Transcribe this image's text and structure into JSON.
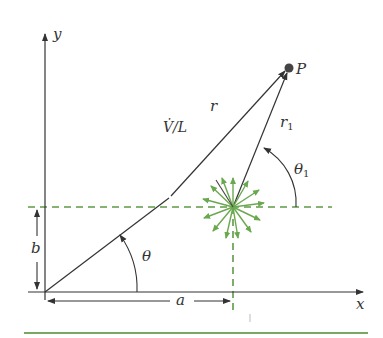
{
  "diagram": {
    "labels": {
      "y_axis": "y",
      "x_axis": "x",
      "point": "P",
      "r": "r",
      "r1": "r",
      "r1_sub": "1",
      "strength": "V̇/L",
      "theta": "θ",
      "theta1": "θ",
      "theta1_sub": "1",
      "a": "a",
      "b": "b"
    },
    "colors": {
      "line": "#333333",
      "source": "#6aa84f",
      "dashed": "#5f9a45",
      "bottom_rule": "#7aa860"
    },
    "geometry": {
      "origin": [
        45,
        292
      ],
      "source": [
        233,
        207
      ],
      "point_P": [
        289,
        68
      ]
    }
  }
}
